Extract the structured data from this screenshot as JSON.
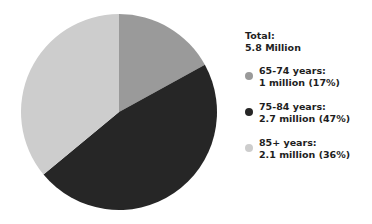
{
  "chart_data": {
    "type": "pie",
    "title": "",
    "total_label": "Total:",
    "total_value": "5.8 Million",
    "start_angle": "12 o'clock, clockwise",
    "slices": [
      {
        "label": "65-74 years:",
        "value_text": "1 million (17%)",
        "value": 1.0,
        "percent": 17,
        "color": "#9a9a9a"
      },
      {
        "label": "75-84 years:",
        "value_text": "2.7 million (47%)",
        "value": 2.7,
        "percent": 47,
        "color": "#262626"
      },
      {
        "label": "85+ years:",
        "value_text": "2.1 million (36%)",
        "value": 2.1,
        "percent": 36,
        "color": "#cdcdcd"
      }
    ],
    "legend_position": "right"
  },
  "legend": {
    "total_label": "Total:",
    "total_value": "5.8 Million",
    "items": [
      {
        "label": "65-74 years:",
        "value": "1 million (17%)"
      },
      {
        "label": "75-84 years:",
        "value": "2.7 million (47%)"
      },
      {
        "label": "85+ years:",
        "value": "2.1 million (36%)"
      }
    ]
  }
}
